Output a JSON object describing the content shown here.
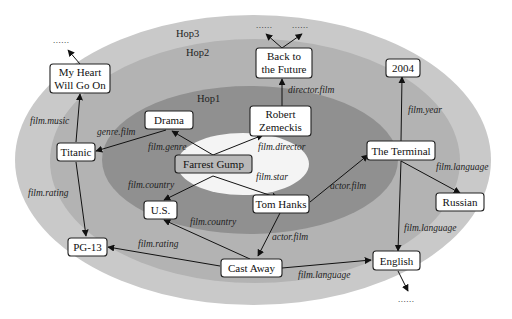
{
  "diagram": {
    "type": "knowledge-graph-hops",
    "rings": [
      {
        "id": "hop3",
        "label": "Hop3",
        "color": "#c9c9c9"
      },
      {
        "id": "hop2",
        "label": "Hop2",
        "color": "#b0b0b0"
      },
      {
        "id": "hop1",
        "label": "Hop1",
        "color": "#8e8e8e"
      },
      {
        "id": "center",
        "label": "",
        "color": "#f4f4f4"
      }
    ],
    "nodes": {
      "forrest_gump": "Farrest Gump",
      "drama": "Drama",
      "robert_line1": "Robert",
      "robert_line2": "Zemeckis",
      "us": "U.S.",
      "tom_hanks": "Tom Hanks",
      "titanic": "Titanic",
      "my_heart_line1": "My Heart",
      "my_heart_line2": "Will Go On",
      "bttf_line1": "Back to",
      "bttf_line2": "the Future",
      "the_terminal": "The Terminal",
      "year_2004": "2004",
      "russian": "Russian",
      "pg13": "PG-13",
      "cast_away": "Cast Away",
      "english": "English"
    },
    "edges": [
      {
        "from": "Farrest Gump",
        "to": "Drama",
        "label": "film.genre"
      },
      {
        "from": "Farrest Gump",
        "to": "Robert Zemeckis",
        "label": "film.director"
      },
      {
        "from": "Farrest Gump",
        "to": "U.S.",
        "label": "film.country"
      },
      {
        "from": "Farrest Gump",
        "to": "Tom Hanks",
        "label": "film.star"
      },
      {
        "from": "Drama",
        "to": "Titanic",
        "label": "genre.film"
      },
      {
        "from": "Titanic",
        "to": "My Heart Will Go On",
        "label": "film.music"
      },
      {
        "from": "Titanic",
        "to": "PG-13",
        "label": "film.rating"
      },
      {
        "from": "Robert Zemeckis",
        "to": "Back to the Future",
        "label": "director.film"
      },
      {
        "from": "Tom Hanks",
        "to": "The Terminal",
        "label": "actor.film"
      },
      {
        "from": "Tom Hanks",
        "to": "Cast Away",
        "label": "actor.film"
      },
      {
        "from": "Cast Away",
        "to": "U.S.",
        "label": "film.country"
      },
      {
        "from": "Cast Away",
        "to": "PG-13",
        "label": "film.rating"
      },
      {
        "from": "Cast Away",
        "to": "English",
        "label": "film.language"
      },
      {
        "from": "The Terminal",
        "to": "2004",
        "label": "film.year"
      },
      {
        "from": "The Terminal",
        "to": "Russian",
        "label": "film.language"
      },
      {
        "from": "The Terminal",
        "to": "English",
        "label": "film.language"
      },
      {
        "from": "My Heart Will Go On",
        "to": "......",
        "label": ""
      },
      {
        "from": "Back to the Future",
        "to": "......",
        "label": ""
      },
      {
        "from": "Back to the Future",
        "to": "......",
        "label": ""
      },
      {
        "from": "English",
        "to": "......",
        "label": ""
      }
    ],
    "ellipsis": "......"
  }
}
